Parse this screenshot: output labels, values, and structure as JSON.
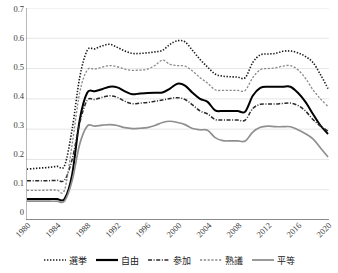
{
  "chart_data": {
    "type": "line",
    "title": "",
    "subtitle": "",
    "xlabel": "",
    "ylabel": "",
    "xlim": [
      1980,
      2020
    ],
    "ylim": [
      0,
      0.7
    ],
    "grid": true,
    "legend_position": "bottom",
    "y_ticks": [
      "0",
      "0.1",
      "0.2",
      "0.3",
      "0.4",
      "0.5",
      "0.6",
      "0.7"
    ],
    "y_tick_values": [
      0,
      0.1,
      0.2,
      0.3,
      0.4,
      0.5,
      0.6,
      0.7
    ],
    "x_ticks": [
      "1980",
      "1984",
      "1988",
      "1992",
      "1996",
      "2000",
      "2004",
      "2008",
      "2012",
      "2016",
      "2020"
    ],
    "x_tick_values": [
      1980,
      1984,
      1988,
      1992,
      1996,
      2000,
      2004,
      2008,
      2012,
      2016,
      2020
    ],
    "x": [
      1980,
      1981,
      1982,
      1983,
      1984,
      1985,
      1986,
      1987,
      1988,
      1989,
      1990,
      1991,
      1992,
      1993,
      1994,
      1995,
      1996,
      1997,
      1998,
      1999,
      2000,
      2001,
      2002,
      2003,
      2004,
      2005,
      2006,
      2007,
      2008,
      2009,
      2010,
      2011,
      2012,
      2013,
      2014,
      2015,
      2016,
      2017,
      2018,
      2019,
      2020
    ],
    "series": [
      {
        "name": "選挙",
        "style": "dotted",
        "color": "#1a1a1a",
        "width": 1.6,
        "values": [
          0.168,
          0.17,
          0.172,
          0.174,
          0.177,
          0.18,
          0.3,
          0.47,
          0.56,
          0.565,
          0.575,
          0.58,
          0.57,
          0.558,
          0.55,
          0.55,
          0.552,
          0.555,
          0.56,
          0.58,
          0.592,
          0.588,
          0.56,
          0.53,
          0.505,
          0.482,
          0.475,
          0.473,
          0.472,
          0.47,
          0.52,
          0.545,
          0.548,
          0.55,
          0.557,
          0.558,
          0.552,
          0.54,
          0.52,
          0.48,
          0.434
        ]
      },
      {
        "name": "自由",
        "style": "solid",
        "color": "#000000",
        "width": 2.0,
        "values": [
          0.069,
          0.069,
          0.069,
          0.069,
          0.069,
          0.07,
          0.15,
          0.33,
          0.42,
          0.425,
          0.432,
          0.44,
          0.438,
          0.425,
          0.415,
          0.418,
          0.419,
          0.42,
          0.421,
          0.434,
          0.45,
          0.444,
          0.42,
          0.4,
          0.39,
          0.362,
          0.36,
          0.36,
          0.36,
          0.358,
          0.41,
          0.436,
          0.44,
          0.44,
          0.44,
          0.44,
          0.42,
          0.39,
          0.35,
          0.312,
          0.284
        ]
      },
      {
        "name": "参加",
        "style": "dashdot",
        "color": "#2a2a2a",
        "width": 1.5,
        "values": [
          0.13,
          0.13,
          0.13,
          0.13,
          0.131,
          0.132,
          0.2,
          0.32,
          0.395,
          0.398,
          0.405,
          0.41,
          0.405,
          0.392,
          0.384,
          0.386,
          0.388,
          0.392,
          0.396,
          0.401,
          0.404,
          0.398,
          0.38,
          0.36,
          0.35,
          0.332,
          0.33,
          0.33,
          0.33,
          0.33,
          0.368,
          0.382,
          0.383,
          0.383,
          0.385,
          0.386,
          0.378,
          0.36,
          0.332,
          0.31,
          0.294
        ]
      },
      {
        "name": "熟議",
        "style": "fine-dotted",
        "color": "#8a8a8a",
        "width": 1.3,
        "values": [
          0.098,
          0.098,
          0.098,
          0.099,
          0.099,
          0.1,
          0.25,
          0.42,
          0.495,
          0.498,
          0.505,
          0.51,
          0.506,
          0.498,
          0.494,
          0.495,
          0.498,
          0.51,
          0.528,
          0.514,
          0.51,
          0.508,
          0.492,
          0.47,
          0.452,
          0.43,
          0.428,
          0.428,
          0.428,
          0.428,
          0.47,
          0.496,
          0.5,
          0.502,
          0.508,
          0.51,
          0.496,
          0.468,
          0.43,
          0.4,
          0.375
        ]
      },
      {
        "name": "平等",
        "style": "solid-gray",
        "color": "#8f8f8f",
        "width": 1.7,
        "values": [
          0.062,
          0.062,
          0.062,
          0.062,
          0.062,
          0.063,
          0.13,
          0.25,
          0.31,
          0.31,
          0.313,
          0.315,
          0.312,
          0.305,
          0.302,
          0.303,
          0.305,
          0.312,
          0.322,
          0.326,
          0.322,
          0.315,
          0.302,
          0.298,
          0.296,
          0.272,
          0.262,
          0.261,
          0.261,
          0.261,
          0.29,
          0.306,
          0.31,
          0.308,
          0.308,
          0.308,
          0.298,
          0.285,
          0.268,
          0.238,
          0.208
        ]
      }
    ]
  },
  "legend": {
    "items": [
      {
        "label": "選挙",
        "swatch": "dotted-swatch"
      },
      {
        "label": "自由",
        "swatch": "solid-swatch"
      },
      {
        "label": "参加",
        "swatch": "dashdot-swatch"
      },
      {
        "label": "熟議",
        "swatch": "fine-dotted-swatch"
      },
      {
        "label": "平等",
        "swatch": "solid-gray-swatch"
      }
    ]
  }
}
